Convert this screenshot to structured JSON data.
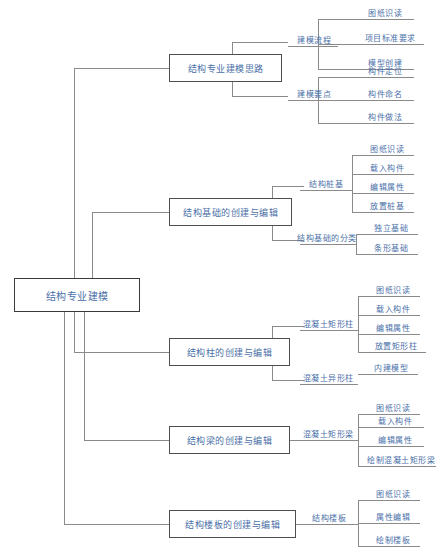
{
  "diagram": {
    "type": "mind-map-tree",
    "title": "结构专业建模",
    "orientation": "left-to-right",
    "colors": {
      "node_text": "#4a6fa8",
      "box_border": "#4f4f4f",
      "connector": "#8a8a8a",
      "background": "#ffffff"
    },
    "root": {
      "label": "结构专业建模"
    },
    "branches": [
      {
        "label": "结构专业建模思路",
        "children": [
          {
            "label": "建模流程",
            "leaves": [
              "图纸识读",
              "项目标准要求",
              "模型创建"
            ]
          },
          {
            "label": "建模要点",
            "leaves": [
              "构件定位",
              "构件命名",
              "构件做法"
            ]
          }
        ]
      },
      {
        "label": "结构基础的创建与编辑",
        "children": [
          {
            "label": "结构桩基",
            "leaves": [
              "图纸识读",
              "载入构件",
              "编辑属性",
              "放置桩基"
            ]
          },
          {
            "label": "结构基础的分类",
            "leaves": [
              "独立基础",
              "条形基础"
            ]
          }
        ]
      },
      {
        "label": "结构柱的创建与编辑",
        "children": [
          {
            "label": "混凝土矩形柱",
            "leaves": [
              "图纸识读",
              "载入构件",
              "编辑属性",
              "放置矩形柱"
            ]
          },
          {
            "label": "混凝土异形柱",
            "leaves": [
              "内建模型"
            ]
          }
        ]
      },
      {
        "label": "结构梁的创建与编辑",
        "children": [
          {
            "label": "混凝土矩形梁",
            "leaves": [
              "图纸识读",
              "载入构件",
              "编辑属性",
              "绘制混凝土矩形梁"
            ]
          }
        ]
      },
      {
        "label": "结构楼板的创建与编辑",
        "children": [
          {
            "label": "结构楼板",
            "leaves": [
              "图纸识读",
              "属性编辑",
              "绘制楼板"
            ]
          }
        ]
      }
    ]
  }
}
